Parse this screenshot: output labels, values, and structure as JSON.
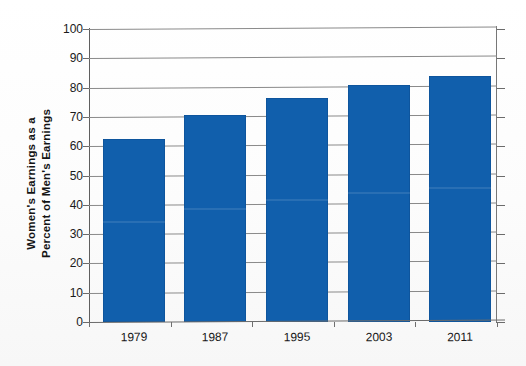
{
  "chart_data": {
    "type": "bar",
    "title": "",
    "xlabel": "",
    "ylabel": "Women's Earnings  as a Percent of Men's Earnings",
    "ylabel_lines": [
      "Women's Earnings  as a",
      "Percent of Men's Earnings"
    ],
    "categories": [
      "1979",
      "1987",
      "1995",
      "2003",
      "2011"
    ],
    "values": [
      62.5,
      70.5,
      76.5,
      80.8,
      84.0
    ],
    "series": [
      {
        "name": "Women's earnings as a percent of men's earnings",
        "values": [
          62.5,
          70.5,
          76.5,
          80.8,
          84.0
        ]
      }
    ],
    "ylim": [
      0,
      100
    ],
    "ytick_labels": [
      "100",
      "90",
      "80",
      "70",
      "60",
      "50",
      "40",
      "30",
      "20",
      "10",
      "0"
    ],
    "ytick_values": [
      100,
      90,
      80,
      70,
      60,
      50,
      40,
      30,
      20,
      10,
      0
    ],
    "grid": true,
    "grid_axis": "y",
    "legend": false,
    "legend_position": "none",
    "bar_color": "#115FAC",
    "gridline_color": "#8a8a8a",
    "axis_color": "#6b6b6b",
    "background_color": "#fdfdfd",
    "text_color": "#1a1a1a"
  }
}
